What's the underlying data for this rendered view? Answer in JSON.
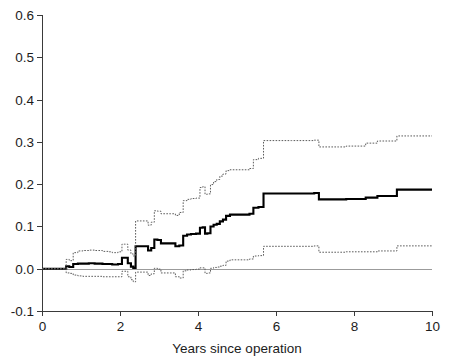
{
  "chart_data": {
    "type": "line",
    "title": "",
    "subtitle": "",
    "xlabel": "Years since operation",
    "ylabel": "",
    "xlim": [
      0,
      10
    ],
    "ylim": [
      -0.1,
      0.6
    ],
    "xticks": [
      0,
      2,
      4,
      6,
      8,
      10
    ],
    "xtick_labels": [
      "0",
      "2",
      "4",
      "6",
      "8",
      "10"
    ],
    "yticks": [
      -0.1,
      0.0,
      0.1,
      0.2,
      0.3,
      0.4,
      0.5,
      0.6
    ],
    "ytick_labels": [
      "-0.1",
      "0.0",
      "0.1",
      "0.2",
      "0.3",
      "0.4",
      "0.5",
      "0.6"
    ],
    "grid": false,
    "legend": "none",
    "annotations": [
      {
        "name": "zero-reference-line",
        "y": 0.0,
        "style": "solid-grey"
      }
    ],
    "step_style": "post",
    "series": [
      {
        "name": "Cumulative incidence estimate",
        "style": "solid",
        "color": "#000000",
        "width": 2.1,
        "x": [
          0.0,
          0.55,
          0.62,
          0.7,
          0.8,
          0.92,
          1.05,
          1.2,
          1.35,
          1.55,
          1.72,
          1.8,
          1.95,
          2.05,
          2.12,
          2.2,
          2.28,
          2.34,
          2.4,
          2.62,
          2.72,
          2.8,
          2.88,
          2.96,
          3.05,
          3.18,
          3.3,
          3.42,
          3.52,
          3.62,
          3.72,
          3.82,
          3.95,
          4.05,
          4.12,
          4.18,
          4.24,
          4.32,
          4.4,
          4.48,
          4.56,
          4.64,
          4.72,
          4.82,
          5.0,
          5.2,
          5.32,
          5.42,
          5.55,
          5.68,
          5.8,
          6.4,
          6.8,
          6.98,
          7.1,
          7.6,
          7.8,
          8.3,
          8.6,
          9.1,
          9.4,
          10.0
        ],
        "y": [
          0.0,
          0.0,
          0.006,
          0.004,
          0.011,
          0.012,
          0.012,
          0.013,
          0.012,
          0.011,
          0.011,
          0.01,
          0.011,
          0.026,
          0.026,
          0.013,
          0.005,
          0.002,
          0.053,
          0.053,
          0.043,
          0.049,
          0.069,
          0.068,
          0.06,
          0.06,
          0.06,
          0.053,
          0.055,
          0.078,
          0.081,
          0.082,
          0.083,
          0.097,
          0.098,
          0.083,
          0.084,
          0.1,
          0.104,
          0.106,
          0.112,
          0.116,
          0.125,
          0.128,
          0.128,
          0.128,
          0.13,
          0.144,
          0.146,
          0.178,
          0.178,
          0.178,
          0.178,
          0.179,
          0.164,
          0.164,
          0.165,
          0.168,
          0.172,
          0.187,
          0.187,
          0.187
        ]
      },
      {
        "name": "Upper 95% confidence limit",
        "style": "dotted",
        "color": "#5c5c5c",
        "width": 1,
        "x": [
          0.0,
          0.55,
          0.62,
          0.7,
          0.8,
          0.92,
          1.05,
          1.2,
          1.35,
          1.55,
          1.72,
          1.8,
          1.95,
          2.05,
          2.12,
          2.2,
          2.28,
          2.34,
          2.4,
          2.62,
          2.72,
          2.8,
          2.88,
          2.96,
          3.05,
          3.18,
          3.3,
          3.42,
          3.52,
          3.62,
          3.72,
          3.82,
          3.95,
          4.05,
          4.12,
          4.18,
          4.24,
          4.32,
          4.4,
          4.48,
          4.56,
          4.64,
          4.72,
          4.82,
          5.0,
          5.2,
          5.32,
          5.42,
          5.55,
          5.68,
          5.8,
          6.4,
          6.8,
          6.98,
          7.1,
          7.6,
          7.8,
          8.3,
          8.6,
          9.1,
          9.4,
          10.0
        ],
        "y": [
          0.0,
          0.0,
          0.022,
          0.019,
          0.038,
          0.042,
          0.043,
          0.044,
          0.043,
          0.041,
          0.04,
          0.038,
          0.04,
          0.058,
          0.058,
          0.044,
          0.035,
          0.03,
          0.113,
          0.113,
          0.103,
          0.11,
          0.137,
          0.136,
          0.13,
          0.13,
          0.13,
          0.126,
          0.133,
          0.161,
          0.164,
          0.166,
          0.167,
          0.192,
          0.194,
          0.176,
          0.177,
          0.199,
          0.206,
          0.211,
          0.219,
          0.224,
          0.232,
          0.234,
          0.234,
          0.234,
          0.237,
          0.258,
          0.261,
          0.303,
          0.303,
          0.303,
          0.303,
          0.304,
          0.288,
          0.288,
          0.29,
          0.297,
          0.302,
          0.314,
          0.314,
          0.314
        ]
      },
      {
        "name": "Lower 95% confidence limit",
        "style": "dotted",
        "color": "#5c5c5c",
        "width": 1,
        "x": [
          0.0,
          0.55,
          0.62,
          0.7,
          0.8,
          0.92,
          1.05,
          1.2,
          1.35,
          1.55,
          1.72,
          1.8,
          1.95,
          2.05,
          2.12,
          2.2,
          2.28,
          2.34,
          2.4,
          2.62,
          2.72,
          2.8,
          2.88,
          2.96,
          3.05,
          3.18,
          3.3,
          3.42,
          3.52,
          3.62,
          3.72,
          3.82,
          3.95,
          4.05,
          4.12,
          4.18,
          4.24,
          4.32,
          4.4,
          4.48,
          4.56,
          4.64,
          4.72,
          4.82,
          5.0,
          5.2,
          5.32,
          5.42,
          5.55,
          5.68,
          5.8,
          6.4,
          6.8,
          6.98,
          7.1,
          7.6,
          7.8,
          8.3,
          8.6,
          9.1,
          9.4,
          10.0
        ],
        "y": [
          0.0,
          0.0,
          -0.01,
          -0.011,
          -0.015,
          -0.017,
          -0.018,
          -0.018,
          -0.018,
          -0.019,
          -0.019,
          -0.019,
          -0.019,
          -0.006,
          -0.006,
          -0.019,
          -0.026,
          -0.031,
          -0.008,
          -0.008,
          -0.016,
          -0.012,
          0.001,
          -0.001,
          -0.01,
          -0.01,
          -0.01,
          -0.019,
          -0.022,
          -0.005,
          -0.003,
          -0.002,
          -0.001,
          0.002,
          0.002,
          -0.011,
          -0.01,
          0.001,
          0.003,
          0.004,
          0.006,
          0.008,
          0.018,
          0.021,
          0.021,
          0.021,
          0.023,
          0.03,
          0.031,
          0.053,
          0.053,
          0.053,
          0.053,
          0.054,
          0.039,
          0.039,
          0.04,
          0.04,
          0.042,
          0.054,
          0.054,
          0.054
        ]
      }
    ]
  },
  "axes": {
    "geometry": {
      "left_px": 42,
      "right_px": 432,
      "top_px": 15,
      "bottom_px": 311
    }
  }
}
